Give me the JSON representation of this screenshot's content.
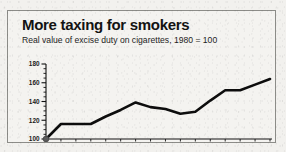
{
  "figure": {
    "background_color": "#f2f1ee",
    "panel_background": "#f4f3f0",
    "border_color": "#8c8c88",
    "line_color": "#0d0d0d",
    "text_color": "#131313"
  },
  "chart_data": {
    "type": "line",
    "title": "More taxing for smokers",
    "subtitle": "Real value of excise duty on cigarettes, 1980 = 100",
    "xlabel": "",
    "ylabel": "",
    "grid": false,
    "legend": false,
    "ylim": [
      100,
      180
    ],
    "yticks": [
      100,
      120,
      140,
      160,
      180
    ],
    "ytick_labels": [
      "100",
      "120",
      "140",
      "160",
      "180"
    ],
    "y_minor_tick_count": 3,
    "categories": [
      "1980",
      "81",
      "82",
      "83",
      "84",
      "85",
      "86",
      "87",
      "88",
      "89",
      "90",
      "91",
      "92",
      "93",
      "94",
      "95"
    ],
    "x": [
      1980,
      1981,
      1982,
      1983,
      1984,
      1985,
      1986,
      1987,
      1988,
      1989,
      1990,
      1991,
      1992,
      1993,
      1994,
      1995
    ],
    "values": [
      100,
      116,
      116,
      116,
      124,
      131,
      139,
      134,
      132,
      127,
      129,
      141,
      152,
      152,
      158,
      164
    ],
    "series": [
      {
        "name": "Real value of excise duty on cigarettes",
        "values": [
          100,
          116,
          116,
          116,
          124,
          131,
          139,
          134,
          132,
          127,
          129,
          141,
          152,
          152,
          158,
          164
        ]
      }
    ],
    "markers": [
      {
        "label": "1980",
        "x": 1980,
        "y": 100
      }
    ]
  }
}
